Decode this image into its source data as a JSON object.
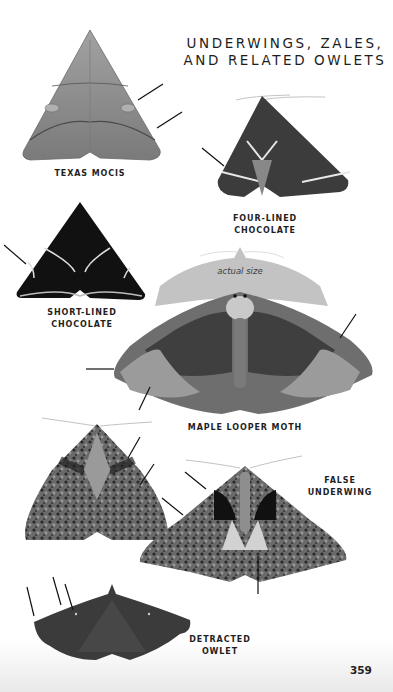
{
  "page": {
    "title_line1": "UNDERWINGS, ZALES,",
    "title_line2": "AND RELATED OWLETS",
    "page_number": "359"
  },
  "species": [
    {
      "id": "texas-mocis",
      "label_line1": "TEXAS MOCIS",
      "label_line2": ""
    },
    {
      "id": "four-lined-chocolate",
      "label_line1": "FOUR-LINED",
      "label_line2": "CHOCOLATE"
    },
    {
      "id": "short-lined-chocolate",
      "label_line1": "SHORT-LINED",
      "label_line2": "CHOCOLATE"
    },
    {
      "id": "maple-looper-moth",
      "label_line1": "MAPLE LOOPER MOTH",
      "label_line2": "",
      "silhouette_caption": "actual size"
    },
    {
      "id": "false-underwing",
      "label_line1": "FALSE",
      "label_line2": "UNDERWING"
    },
    {
      "id": "detracted-owlet",
      "label_line1": "DETRACTED",
      "label_line2": "OWLET"
    }
  ],
  "colors": {
    "text": "#1e1e1e",
    "silhouette": "#c3c3c3",
    "texas_mocis": "#8a8a8a",
    "four_lined": "#3e3e3e",
    "short_lined": "#111111",
    "maple_looper": "#6c6c6c",
    "false_underwing": "#4a4a4a",
    "detracted_owlet": "#3a3a3a"
  }
}
